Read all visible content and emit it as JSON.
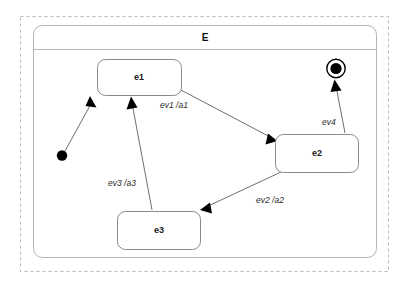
{
  "diagram": {
    "kind": "uml-state-machine",
    "region": {
      "title": "E"
    },
    "states": [
      {
        "id": "e1",
        "label": "e1"
      },
      {
        "id": "e2",
        "label": "e2"
      },
      {
        "id": "e3",
        "label": "e3"
      }
    ],
    "pseudostates": [
      {
        "id": "initial",
        "name": "initial-state"
      },
      {
        "id": "final",
        "name": "final-state"
      }
    ],
    "transitions": [
      {
        "id": "t0",
        "from": "initial",
        "to": "e1",
        "label": ""
      },
      {
        "id": "t1",
        "from": "e1",
        "to": "e2",
        "label": "ev1 /a1"
      },
      {
        "id": "t2",
        "from": "e2",
        "to": "e3",
        "label": "ev2 /a2"
      },
      {
        "id": "t3",
        "from": "e3",
        "to": "e1",
        "label": "ev3 /a3"
      },
      {
        "id": "t4",
        "from": "e2",
        "to": "final",
        "label": "ev4"
      }
    ],
    "colors": {
      "background": "#ffffff",
      "state_stroke": "#8a8a8a",
      "region_stroke": "#b5b5b5",
      "outer_dashed_stroke": "#b8b8b8",
      "transition_stroke": "#6f6f6f",
      "text": "#1a1a1a",
      "marker_fill": "#000000"
    }
  }
}
